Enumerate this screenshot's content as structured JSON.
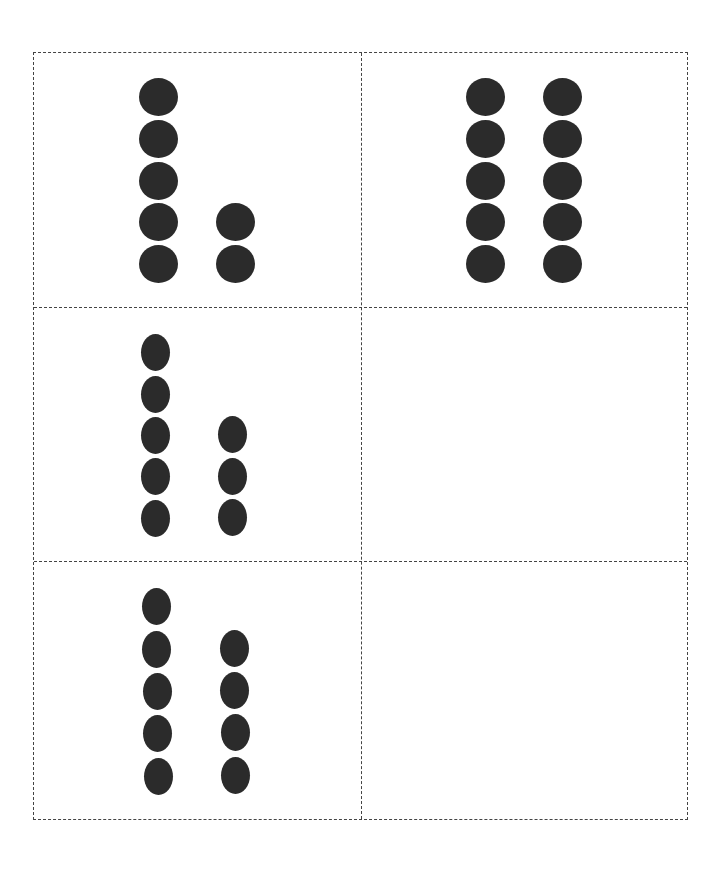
{
  "worksheet": {
    "title": "",
    "colors": {
      "dot": "#2b2b2b",
      "border": "#444444",
      "background": "#ffffff"
    },
    "grid": {
      "rows": 3,
      "columns": 2
    },
    "cells": [
      {
        "id": 1,
        "row": 1,
        "col": 1,
        "columns": [
          5,
          2
        ],
        "total": 7,
        "dots": [
          {
            "x": 139,
            "y": 78,
            "w": 39,
            "h": 38
          },
          {
            "x": 139,
            "y": 120,
            "w": 39,
            "h": 38
          },
          {
            "x": 139,
            "y": 162,
            "w": 39,
            "h": 38
          },
          {
            "x": 139,
            "y": 203,
            "w": 39,
            "h": 38
          },
          {
            "x": 139,
            "y": 245,
            "w": 39,
            "h": 38
          },
          {
            "x": 216,
            "y": 203,
            "w": 39,
            "h": 38
          },
          {
            "x": 216,
            "y": 245,
            "w": 39,
            "h": 38
          }
        ]
      },
      {
        "id": 2,
        "row": 1,
        "col": 2,
        "columns": [
          5,
          5
        ],
        "total": 10,
        "dots": [
          {
            "x": 466,
            "y": 78,
            "w": 39,
            "h": 38
          },
          {
            "x": 466,
            "y": 120,
            "w": 39,
            "h": 38
          },
          {
            "x": 466,
            "y": 162,
            "w": 39,
            "h": 38
          },
          {
            "x": 466,
            "y": 203,
            "w": 39,
            "h": 38
          },
          {
            "x": 466,
            "y": 245,
            "w": 39,
            "h": 38
          },
          {
            "x": 543,
            "y": 78,
            "w": 39,
            "h": 38
          },
          {
            "x": 543,
            "y": 120,
            "w": 39,
            "h": 38
          },
          {
            "x": 543,
            "y": 162,
            "w": 39,
            "h": 38
          },
          {
            "x": 543,
            "y": 203,
            "w": 39,
            "h": 38
          },
          {
            "x": 543,
            "y": 245,
            "w": 39,
            "h": 38
          }
        ]
      },
      {
        "id": 3,
        "row": 2,
        "col": 1,
        "columns": [
          5,
          3
        ],
        "total": 8,
        "dots": [
          {
            "x": 141,
            "y": 334,
            "w": 29,
            "h": 37
          },
          {
            "x": 141,
            "y": 376,
            "w": 29,
            "h": 37
          },
          {
            "x": 141,
            "y": 417,
            "w": 29,
            "h": 37
          },
          {
            "x": 141,
            "y": 458,
            "w": 29,
            "h": 37
          },
          {
            "x": 141,
            "y": 500,
            "w": 29,
            "h": 37
          },
          {
            "x": 218,
            "y": 416,
            "w": 29,
            "h": 37
          },
          {
            "x": 218,
            "y": 458,
            "w": 29,
            "h": 37
          },
          {
            "x": 218,
            "y": 499,
            "w": 29,
            "h": 37
          }
        ]
      },
      {
        "id": 4,
        "row": 2,
        "col": 2,
        "columns": [],
        "total": 0,
        "dots": []
      },
      {
        "id": 5,
        "row": 3,
        "col": 1,
        "columns": [
          5,
          4
        ],
        "total": 9,
        "dots": [
          {
            "x": 142,
            "y": 588,
            "w": 29,
            "h": 37
          },
          {
            "x": 142,
            "y": 631,
            "w": 29,
            "h": 37
          },
          {
            "x": 143,
            "y": 673,
            "w": 29,
            "h": 37
          },
          {
            "x": 143,
            "y": 715,
            "w": 29,
            "h": 37
          },
          {
            "x": 144,
            "y": 758,
            "w": 29,
            "h": 37
          },
          {
            "x": 220,
            "y": 630,
            "w": 29,
            "h": 37
          },
          {
            "x": 220,
            "y": 672,
            "w": 29,
            "h": 37
          },
          {
            "x": 221,
            "y": 714,
            "w": 29,
            "h": 37
          },
          {
            "x": 221,
            "y": 757,
            "w": 29,
            "h": 37
          }
        ]
      },
      {
        "id": 6,
        "row": 3,
        "col": 2,
        "columns": [],
        "total": 0,
        "dots": []
      }
    ]
  }
}
